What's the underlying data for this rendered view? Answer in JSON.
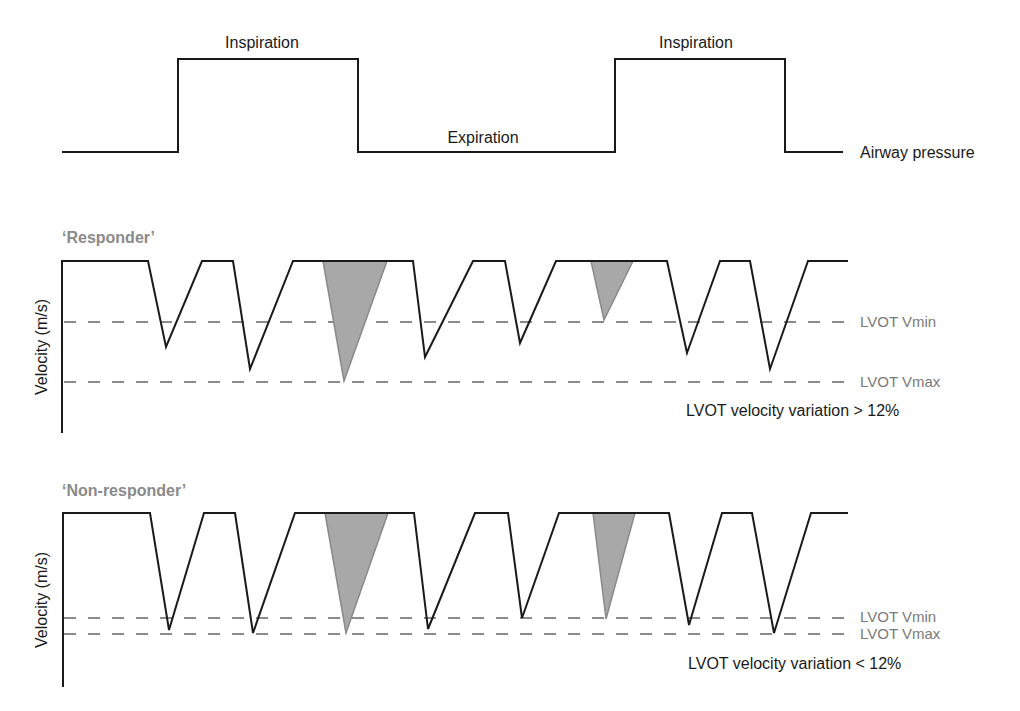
{
  "airway": {
    "label": "Airway pressure",
    "phases": [
      {
        "label": "Inspiration",
        "x": 262,
        "y": 48
      },
      {
        "label": "Expiration",
        "x": 483,
        "y": 143
      },
      {
        "label": "Inspiration",
        "x": 696,
        "y": 48
      }
    ],
    "path": "M62,152 L178,152 L178,59 L358,59 L358,152 L615,152 L615,59 L785,59 L785,152 L843,152"
  },
  "panels": [
    {
      "title": "‘Responder’",
      "y_axis_label": "Velocity (m/s)",
      "vmin_label": "LVOT Vmin",
      "vmax_label": "LVOT Vmax",
      "variation_text": "LVOT velocity variation > 12%",
      "top_y": 261,
      "axis_bottom": 433,
      "vmin_y": 322,
      "vmax_y": 382,
      "title_y": 243,
      "variation_y": 416,
      "vmin_label_y": 327,
      "vmax_label_y": 387,
      "beats": [
        {
          "x0": 148,
          "xa": 166,
          "ya": 347,
          "x1": 202,
          "shaded": false
        },
        {
          "x0": 233,
          "xa": 250,
          "ya": 369,
          "x1": 293,
          "shaded": false
        },
        {
          "x0": 323,
          "xa": 344,
          "ya": 381,
          "x1": 387,
          "shaded": true
        },
        {
          "x0": 413,
          "xa": 425,
          "ya": 357,
          "x1": 473,
          "shaded": false
        },
        {
          "x0": 505,
          "xa": 520,
          "ya": 343,
          "x1": 556,
          "shaded": false
        },
        {
          "x0": 591,
          "xa": 604,
          "ya": 320,
          "x1": 633,
          "shaded": true
        },
        {
          "x0": 667,
          "xa": 687,
          "ya": 353,
          "x1": 720,
          "shaded": false
        },
        {
          "x0": 750,
          "xa": 770,
          "ya": 369,
          "x1": 808,
          "shaded": false
        }
      ]
    },
    {
      "title": "‘Non-responder’",
      "y_axis_label": "Velocity (m/s)",
      "vmin_label": "LVOT Vmin",
      "vmax_label": "LVOT Vmax",
      "variation_text": "LVOT velocity variation < 12%",
      "top_y": 513,
      "axis_bottom": 687,
      "vmin_y": 618,
      "vmax_y": 634,
      "title_y": 496,
      "variation_y": 669,
      "vmin_label_y": 622,
      "vmax_label_y": 638,
      "beats": [
        {
          "x0": 150,
          "xa": 169,
          "ya": 630,
          "x1": 204,
          "shaded": false
        },
        {
          "x0": 235,
          "xa": 253,
          "ya": 633,
          "x1": 295,
          "shaded": false
        },
        {
          "x0": 325,
          "xa": 346,
          "ya": 633,
          "x1": 388,
          "shaded": true
        },
        {
          "x0": 414,
          "xa": 428,
          "ya": 629,
          "x1": 475,
          "shaded": false
        },
        {
          "x0": 508,
          "xa": 522,
          "ya": 618,
          "x1": 559,
          "shaded": false
        },
        {
          "x0": 593,
          "xa": 606,
          "ya": 619,
          "x1": 635,
          "shaded": true
        },
        {
          "x0": 669,
          "xa": 689,
          "ya": 625,
          "x1": 722,
          "shaded": false
        },
        {
          "x0": 752,
          "xa": 774,
          "ya": 633,
          "x1": 811,
          "shaded": false
        }
      ]
    }
  ]
}
